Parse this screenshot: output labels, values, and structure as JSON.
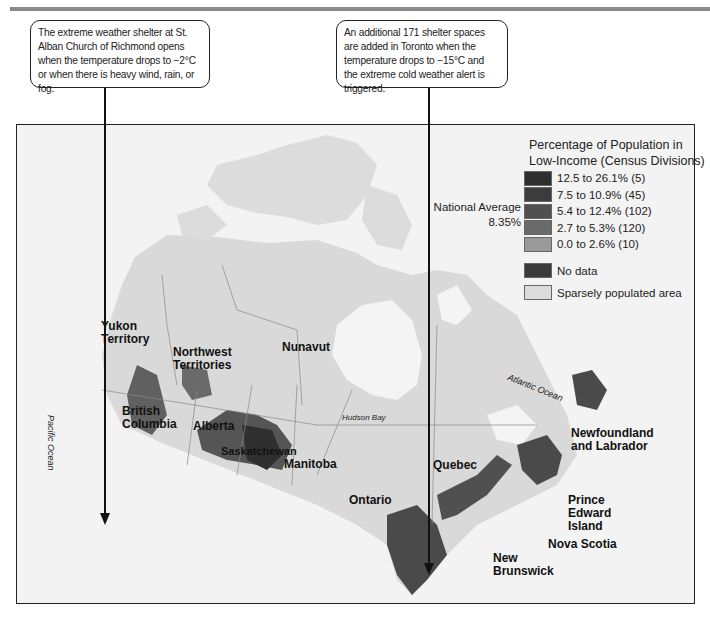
{
  "callouts": [
    {
      "text": "The extreme weather shelter at St. Alban Church of Richmond opens when the temperature drops to −2°C or when there is heavy wind, rain, or fog."
    },
    {
      "text": "An additional 171 shelter spaces are added in Toronto when the temperature drops to −15°C and the extreme cold weather alert is triggered."
    }
  ],
  "legend": {
    "title_line1": "Percentage of Population in",
    "title_line2": "Low-Income (Census Divisions)",
    "national_average_label": "National Average",
    "national_average_value": "8.35%",
    "items": [
      {
        "label": "12.5 to 26.1% (5)",
        "color": "#2f2f2f"
      },
      {
        "label": "7.5 to 10.9% (45)",
        "color": "#3c3c3c"
      },
      {
        "label": "5.4 to 12.4% (102)",
        "color": "#505050"
      },
      {
        "label": "2.7 to 5.3% (120)",
        "color": "#6a6a6a"
      },
      {
        "label": "0.0 to 2.6% (10)",
        "color": "#9a9a9a"
      },
      {
        "label": "No data",
        "color": "#3a3a3a"
      },
      {
        "label": "Sparsely populated area",
        "color": "#dcdcdc"
      }
    ]
  },
  "map": {
    "provinces": {
      "yukon": "Yukon\nTerritory",
      "nwt": "Northwest\nTerritories",
      "nunavut": "Nunavut",
      "bc": "British\nColumbia",
      "alberta": "Alberta",
      "saskatchewan": "Saskatchewan",
      "manitoba": "Manitoba",
      "ontario": "Ontario",
      "quebec": "Quebec",
      "nl": "Newfoundland\nand Labrador",
      "pei": "Prince\nEdward\nIsland",
      "ns": "Nova Scotia",
      "nb": "New\nBrunswick"
    },
    "water": {
      "pacific": "Pacific Ocean",
      "atlantic": "Atlantic Ocean",
      "hudson": "Hudson Bay"
    }
  }
}
